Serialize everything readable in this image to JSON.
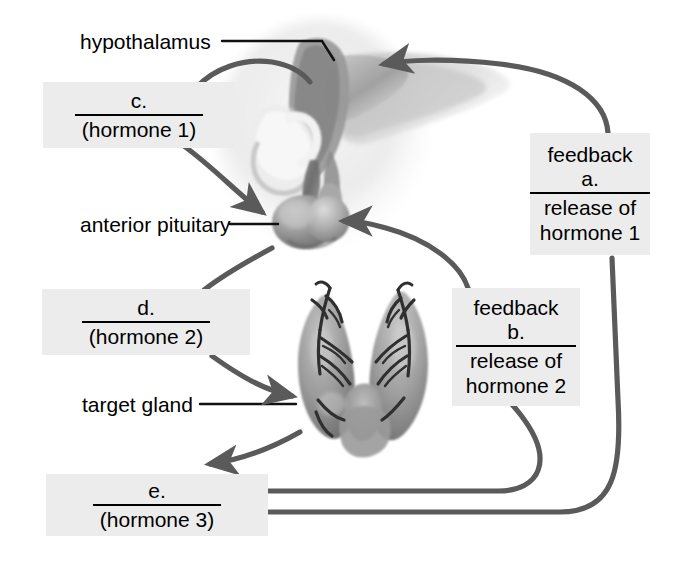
{
  "diagram": {
    "background_color": "#ffffff",
    "box_fill_color": "#ececec",
    "arrow_color": "#555555",
    "text_color": "#000000"
  },
  "anatomy_labels": [
    {
      "id": "hypothalamus",
      "text": "hypothalamus"
    },
    {
      "id": "anterior-pituitary",
      "text": "anterior pituitary"
    },
    {
      "id": "target-gland",
      "text": "target gland"
    }
  ],
  "answer_boxes": [
    {
      "id": "c",
      "blank": "c.",
      "sub": "(hormone 1)"
    },
    {
      "id": "d",
      "blank": "d.",
      "sub": "(hormone 2)"
    },
    {
      "id": "e",
      "blank": "e.",
      "sub": "(hormone 3)"
    }
  ],
  "feedback_boxes": [
    {
      "id": "a",
      "pre": "feedback",
      "blank": "a.",
      "line1": "release of",
      "line2": "hormone 1"
    },
    {
      "id": "b",
      "pre": "feedback",
      "blank": "b.",
      "line1": "release of",
      "line2": "hormone 2"
    }
  ]
}
